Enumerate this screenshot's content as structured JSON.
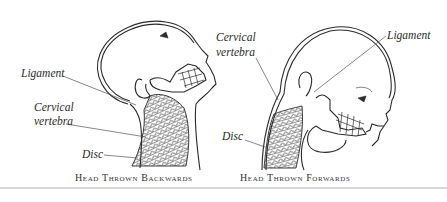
{
  "figures": [
    {
      "id": "backwards",
      "caption": "Head Thrown Backwards",
      "labels": {
        "ligament": "Ligament",
        "cervical_1": "Cervical",
        "cervical_2": "vertebra",
        "disc": "Disc"
      }
    },
    {
      "id": "forwards",
      "caption": "Head Thrown Forwards",
      "labels": {
        "cervical_1": "Cervical",
        "cervical_2": "vertebra",
        "ligament": "Ligament",
        "disc": "Disc"
      }
    }
  ],
  "colors": {
    "line": "#2b2b2b",
    "leader": "#555555",
    "rule": "#d8d8d8"
  }
}
